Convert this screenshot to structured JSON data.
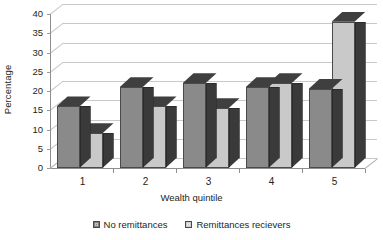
{
  "chart_data": {
    "type": "bar",
    "title": "",
    "xlabel": "Wealth quintile",
    "ylabel": "Percentage",
    "categories": [
      "1",
      "2",
      "3",
      "4",
      "5"
    ],
    "series": [
      {
        "name": "No remittances",
        "color": "#8a8a8a",
        "values": [
          16,
          21,
          22,
          21,
          20.5
        ]
      },
      {
        "name": "Remittances recievers",
        "color": "#c9c9c9",
        "values": [
          9,
          16,
          15.5,
          22,
          38
        ]
      }
    ],
    "ylim": [
      0,
      40
    ],
    "yticks": [
      0,
      5,
      10,
      15,
      20,
      25,
      30,
      35,
      40
    ],
    "grid": true,
    "legend_position": "bottom",
    "three_d": true
  },
  "legend": {
    "items": [
      {
        "label": "No remittances",
        "swatch": "dark-swatch-icon"
      },
      {
        "label": "Remittances recievers",
        "swatch": "light-swatch-icon"
      }
    ]
  }
}
